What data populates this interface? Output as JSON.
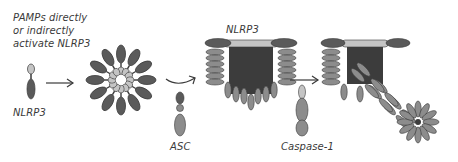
{
  "diagram": {
    "title_note": {
      "line1": "PAMPs directly",
      "line2": "or indirectly",
      "line3": "activate NLRP3"
    },
    "labels": {
      "nlrp3_monomer": "NLRP3",
      "nlrp3_complex": "NLRP3",
      "asc": "ASC",
      "caspase": "Caspase-1"
    },
    "stages": [
      {
        "name": "NLRP3 monomer"
      },
      {
        "name": "NLRP3 oligomer ring"
      },
      {
        "name": "NLRP3 + ASC complex"
      },
      {
        "name": "Inflammasome with Caspase-1 filament"
      }
    ],
    "colors": {
      "dark": "#5a5a5a",
      "mid": "#8c8c8c",
      "light": "#c4c4c4",
      "core": "#3c3c3c",
      "outline": "#3a3a3a",
      "arrow": "#3a3a3a"
    }
  }
}
